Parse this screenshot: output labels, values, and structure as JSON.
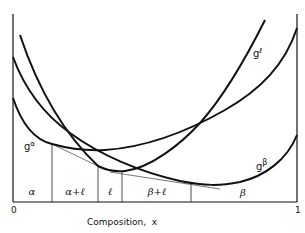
{
  "diagram": {
    "xlabel": "Composition,  x",
    "x_ticks": {
      "left": "0",
      "right": "1"
    },
    "curves": [
      {
        "name": "g-alpha",
        "label_base": "g",
        "label_sup": "α"
      },
      {
        "name": "g-liquid",
        "label_base": "g",
        "label_sup": "ℓ"
      },
      {
        "name": "g-beta",
        "label_base": "g",
        "label_sup": "β"
      }
    ],
    "regions": [
      "α",
      "α+ℓ",
      "ℓ",
      "β+ℓ",
      "β"
    ],
    "colors": {
      "line": "#111111",
      "tangent": "#555555",
      "background": "#ffffff"
    }
  }
}
